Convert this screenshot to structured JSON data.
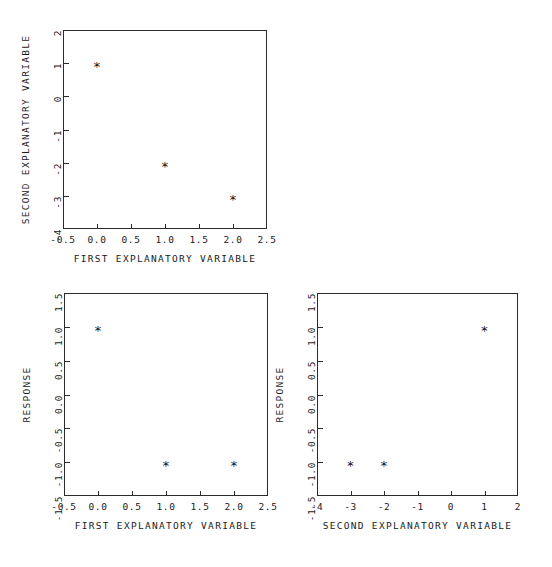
{
  "figure": {
    "background": "#ffffff",
    "ink_color": "#1a1a1a",
    "marker_symbol": "*"
  },
  "chart_data": [
    {
      "id": "top-scatter",
      "type": "scatter",
      "title": "",
      "xlabel": "FIRST EXPLANATORY VARIABLE",
      "ylabel": "SECOND EXPLANATORY VARIABLE",
      "xlim": [
        -0.5,
        2.5
      ],
      "ylim": [
        -4,
        2
      ],
      "xticks": [
        -0.5,
        0.0,
        0.5,
        1.0,
        1.5,
        2.0,
        2.5
      ],
      "xticklabels": [
        "-0.5",
        "0.0",
        "0.5",
        "1.0",
        "1.5",
        "2.0",
        "2.5"
      ],
      "yticks": [
        -4,
        -3,
        -2,
        -1,
        0,
        1,
        2
      ],
      "yticklabels": [
        "-4",
        "-3",
        "-2",
        "-1",
        "0",
        "1",
        "2"
      ],
      "grid": false,
      "legend": null,
      "x": [
        0,
        1,
        2
      ],
      "y": [
        1,
        -2,
        -3
      ],
      "points": [
        {
          "x": 0,
          "y": 1
        },
        {
          "x": 1,
          "y": -2
        },
        {
          "x": 2,
          "y": -3
        }
      ]
    },
    {
      "id": "bottom-left-scatter",
      "type": "scatter",
      "title": "",
      "xlabel": "FIRST EXPLANATORY VARIABLE",
      "ylabel": "RESPONSE",
      "xlim": [
        -0.5,
        2.5
      ],
      "ylim": [
        -1.5,
        1.5
      ],
      "xticks": [
        -0.5,
        0.0,
        0.5,
        1.0,
        1.5,
        2.0,
        2.5
      ],
      "xticklabels": [
        "-0.5",
        "0.0",
        "0.5",
        "1.0",
        "1.5",
        "2.0",
        "2.5"
      ],
      "yticks": [
        -1.5,
        -1.0,
        -0.5,
        0.0,
        0.5,
        1.0,
        1.5
      ],
      "yticklabels": [
        "-1.5",
        "-1.0",
        "-0.5",
        "0.0",
        "0.5",
        "1.0",
        "1.5"
      ],
      "grid": false,
      "legend": null,
      "x": [
        0,
        1,
        2
      ],
      "y": [
        1.0,
        -1.0,
        -1.0
      ],
      "points": [
        {
          "x": 0,
          "y": 1.0
        },
        {
          "x": 1,
          "y": -1.0
        },
        {
          "x": 2,
          "y": -1.0
        }
      ]
    },
    {
      "id": "bottom-right-scatter",
      "type": "scatter",
      "title": "",
      "xlabel": "SECOND EXPLANATORY VARIABLE",
      "ylabel": "RESPONSE",
      "xlim": [
        -4,
        2
      ],
      "ylim": [
        -1.5,
        1.5
      ],
      "xticks": [
        -4,
        -3,
        -2,
        -1,
        0,
        1,
        2
      ],
      "xticklabels": [
        "-4",
        "-3",
        "-2",
        "-1",
        "0",
        "1",
        "2"
      ],
      "yticks": [
        -1.5,
        -1.0,
        -0.5,
        0.0,
        0.5,
        1.0,
        1.5
      ],
      "yticklabels": [
        "-1.5",
        "-1.0",
        "-0.5",
        "0.0",
        "0.5",
        "1.0",
        "1.5"
      ],
      "grid": false,
      "legend": null,
      "x": [
        -3,
        -2,
        1
      ],
      "y": [
        -1.0,
        -1.0,
        1.0
      ],
      "points": [
        {
          "x": -3,
          "y": -1.0
        },
        {
          "x": -2,
          "y": -1.0
        },
        {
          "x": 1,
          "y": 1.0
        }
      ]
    }
  ],
  "panels": [
    {
      "name": "top-scatter",
      "frame": {
        "left": 63,
        "top": 30,
        "width": 204,
        "height": 199
      }
    },
    {
      "name": "bottom-left-scatter",
      "frame": {
        "left": 64,
        "top": 293,
        "width": 204,
        "height": 203
      }
    },
    {
      "name": "bottom-right-scatter",
      "frame": {
        "left": 317,
        "top": 293,
        "width": 201,
        "height": 203
      }
    }
  ]
}
